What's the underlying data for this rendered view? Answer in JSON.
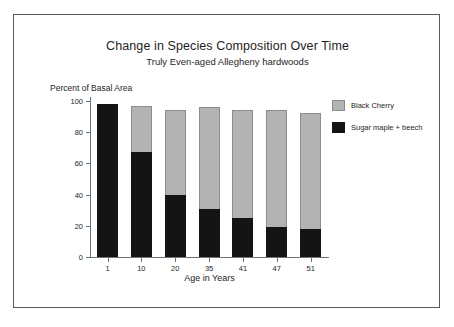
{
  "chart_data": {
    "type": "bar",
    "subtype": "stacked-bar",
    "title": "Change in Species Composition Over Time",
    "subtitle": "Truly Even-aged Allegheny hardwoods",
    "xlabel": "Age in Years",
    "ylabel": "Percent of Basal Area",
    "categories": [
      "1",
      "10",
      "20",
      "35",
      "41",
      "47",
      "51"
    ],
    "series": [
      {
        "name": "Sugar maple + beech",
        "color": "#141414",
        "values": [
          98,
          67,
          39.5,
          31,
          25,
          19,
          18
        ]
      },
      {
        "name": "Black Cherry",
        "color": "#b3b3b3",
        "values": [
          0,
          30,
          54.5,
          65,
          69,
          75,
          74
        ]
      }
    ],
    "totals": [
      98,
      97,
      94,
      96,
      94,
      94,
      92
    ],
    "ylim": [
      0,
      100
    ],
    "yticks": [
      "0",
      "20",
      "40",
      "60",
      "80",
      "100"
    ],
    "ytick_values": [
      0,
      20,
      40,
      60,
      80,
      100
    ],
    "grid": false,
    "legend_position": "right"
  },
  "legend": {
    "items": [
      {
        "label": "Black Cherry",
        "swatch": "sw-cherry"
      },
      {
        "label": "Sugar maple + beech",
        "swatch": "sw-maple"
      }
    ]
  }
}
